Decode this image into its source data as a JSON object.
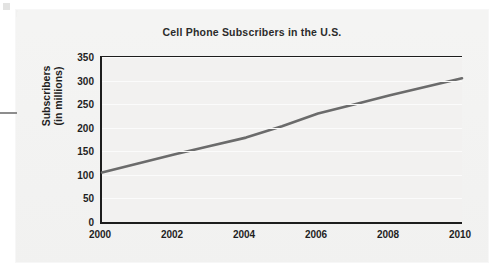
{
  "chart_data": {
    "type": "line",
    "title": "Cell Phone Subscribers in the U.S.",
    "xlabel": "",
    "ylabel": "Subscribers (in millions)",
    "ylabel_line1": "Subscribers",
    "ylabel_line2": "(in millions)",
    "xlim": [
      2000,
      2010
    ],
    "ylim": [
      0,
      350
    ],
    "grid": true,
    "legend": null,
    "series_color": "#6b6b6b",
    "axis_color": "#1d1d1d",
    "plot_background": "#f2f1f0",
    "panel_background": "#f4f4f3",
    "x_tick_labels": [
      "2000",
      "2002",
      "2004",
      "2006",
      "2008",
      "2010"
    ],
    "x_ticks": [
      2000,
      2002,
      2004,
      2006,
      2008,
      2010
    ],
    "y_tick_labels": [
      "0",
      "50",
      "100",
      "150",
      "200",
      "250",
      "300",
      "350"
    ],
    "y_ticks": [
      0,
      50,
      100,
      150,
      200,
      250,
      300,
      350
    ],
    "x": [
      2000,
      2001,
      2002,
      2003,
      2004,
      2005,
      2006,
      2007,
      2008,
      2009,
      2010
    ],
    "values": [
      105,
      124,
      143,
      161,
      179,
      203,
      230,
      249,
      269,
      287,
      305
    ],
    "series": [
      {
        "name": "Cell phone subscribers",
        "values": [
          105,
          124,
          143,
          161,
          179,
          203,
          230,
          249,
          269,
          287,
          305
        ]
      }
    ]
  }
}
